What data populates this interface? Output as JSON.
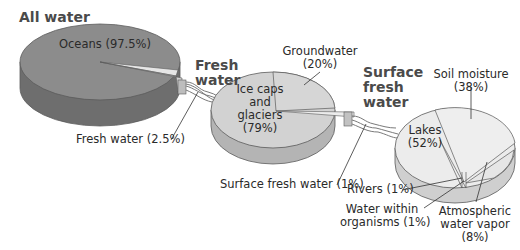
{
  "diagram": {
    "type": "exploded-pie-chain",
    "colors": {
      "oceans_top": "#8c8c8c",
      "oceans_side": "#6e6e6e",
      "fresh_top": "#d2d2d2",
      "fresh_side": "#b4b4b4",
      "surface_top": "#ececec",
      "surface_side": "#cfcfcf",
      "stroke": "#5a5a5a"
    },
    "pies": [
      {
        "title": "All water",
        "slices": [
          {
            "label": "Oceans (97.5%)",
            "name": "Oceans",
            "value": 97.5
          },
          {
            "label": "Fresh water (2.5%)",
            "name": "Fresh water",
            "value": 2.5
          }
        ]
      },
      {
        "title_line1": "Fresh",
        "title_line2": "water",
        "slices": [
          {
            "label_lines": [
              "Ice caps",
              "and",
              "glaciers",
              "(79%)"
            ],
            "name": "Ice caps and glaciers",
            "value": 79
          },
          {
            "label_lines": [
              "Groundwater",
              "(20%)"
            ],
            "name": "Groundwater",
            "value": 20
          },
          {
            "label": "Surface fresh water (1%)",
            "name": "Surface fresh water",
            "value": 1
          }
        ]
      },
      {
        "title_line1": "Surface",
        "title_line2": "fresh",
        "title_line3": "water",
        "slices": [
          {
            "label_lines": [
              "Lakes",
              "(52%)"
            ],
            "name": "Lakes",
            "value": 52
          },
          {
            "label_lines": [
              "Soil moisture",
              "(38%)"
            ],
            "name": "Soil moisture",
            "value": 38
          },
          {
            "label_lines": [
              "Atmospheric",
              "water vapor",
              "(8%)"
            ],
            "name": "Atmospheric water vapor",
            "value": 8
          },
          {
            "label": "Rivers (1%)",
            "name": "Rivers",
            "value": 1
          },
          {
            "label_lines": [
              "Water within",
              "organisms (1%)"
            ],
            "name": "Water within organisms",
            "value": 1
          }
        ]
      }
    ]
  }
}
